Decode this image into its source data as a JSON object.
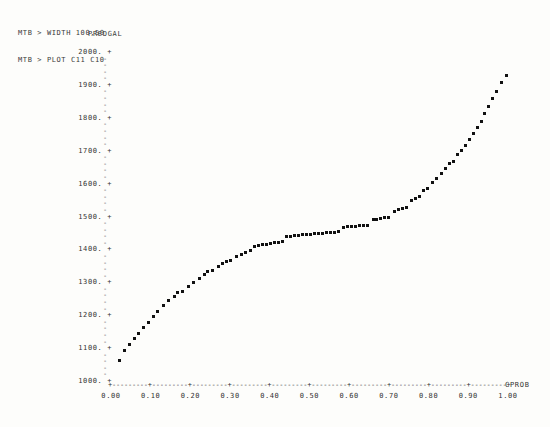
{
  "terminal": {
    "commands": [
      "MTB > WIDTH 100,50",
      "MTB > PLOT C11 C10"
    ]
  },
  "chart_data": {
    "type": "scatter",
    "title": "",
    "xlabel": "CPROB",
    "ylabel": "PREDGAL",
    "xlim": [
      0.0,
      1.0
    ],
    "ylim": [
      1000,
      2000
    ],
    "grid": false,
    "legend": null,
    "y_major_ticks": [
      "2000.",
      "1900.",
      "1800.",
      "1700.",
      "1600.",
      "1500.",
      "1400.",
      "1300.",
      "1200.",
      "1100.",
      "1000."
    ],
    "y_major_values": [
      2000,
      1900,
      1800,
      1700,
      1600,
      1500,
      1400,
      1300,
      1200,
      1100,
      1000
    ],
    "y_tick_glyph": "+",
    "y_minor_glyph": "-",
    "y_minor_per_interval": 4,
    "x_tick_labels": [
      "0.00",
      "0.10",
      "0.20",
      "0.30",
      "0.40",
      "0.50",
      "0.60",
      "0.70",
      "0.80",
      "0.90",
      "1.00"
    ],
    "x_tick_values": [
      0.0,
      0.1,
      0.2,
      0.3,
      0.4,
      0.5,
      0.6,
      0.7,
      0.8,
      0.9,
      1.0
    ],
    "x_axis_tick_glyph": "+",
    "x_axis_fill_glyph": "-",
    "point_glyph": "*",
    "points": [
      [
        0.022,
        1063
      ],
      [
        0.034,
        1092
      ],
      [
        0.046,
        1112
      ],
      [
        0.058,
        1128
      ],
      [
        0.07,
        1145
      ],
      [
        0.082,
        1163
      ],
      [
        0.094,
        1178
      ],
      [
        0.106,
        1196
      ],
      [
        0.118,
        1212
      ],
      [
        0.132,
        1228
      ],
      [
        0.146,
        1244
      ],
      [
        0.16,
        1258
      ],
      [
        0.168,
        1268
      ],
      [
        0.18,
        1272
      ],
      [
        0.194,
        1286
      ],
      [
        0.208,
        1300
      ],
      [
        0.222,
        1312
      ],
      [
        0.236,
        1324
      ],
      [
        0.244,
        1332
      ],
      [
        0.256,
        1336
      ],
      [
        0.27,
        1348
      ],
      [
        0.282,
        1358
      ],
      [
        0.29,
        1362
      ],
      [
        0.302,
        1366
      ],
      [
        0.316,
        1378
      ],
      [
        0.328,
        1384
      ],
      [
        0.34,
        1390
      ],
      [
        0.352,
        1396
      ],
      [
        0.362,
        1410
      ],
      [
        0.372,
        1412
      ],
      [
        0.382,
        1414
      ],
      [
        0.392,
        1416
      ],
      [
        0.402,
        1418
      ],
      [
        0.412,
        1420
      ],
      [
        0.422,
        1422
      ],
      [
        0.432,
        1424
      ],
      [
        0.442,
        1438
      ],
      [
        0.452,
        1440
      ],
      [
        0.462,
        1442
      ],
      [
        0.472,
        1443
      ],
      [
        0.482,
        1444
      ],
      [
        0.492,
        1445
      ],
      [
        0.502,
        1446
      ],
      [
        0.512,
        1447
      ],
      [
        0.522,
        1448
      ],
      [
        0.532,
        1449
      ],
      [
        0.542,
        1450
      ],
      [
        0.552,
        1451
      ],
      [
        0.562,
        1452
      ],
      [
        0.572,
        1453
      ],
      [
        0.586,
        1468
      ],
      [
        0.596,
        1469
      ],
      [
        0.606,
        1470
      ],
      [
        0.616,
        1471
      ],
      [
        0.626,
        1472
      ],
      [
        0.636,
        1473
      ],
      [
        0.646,
        1474
      ],
      [
        0.66,
        1490
      ],
      [
        0.67,
        1492
      ],
      [
        0.68,
        1494
      ],
      [
        0.69,
        1496
      ],
      [
        0.7,
        1498
      ],
      [
        0.714,
        1516
      ],
      [
        0.724,
        1520
      ],
      [
        0.734,
        1524
      ],
      [
        0.744,
        1528
      ],
      [
        0.756,
        1548
      ],
      [
        0.766,
        1554
      ],
      [
        0.776,
        1562
      ],
      [
        0.788,
        1578
      ],
      [
        0.798,
        1586
      ],
      [
        0.81,
        1604
      ],
      [
        0.82,
        1614
      ],
      [
        0.832,
        1632
      ],
      [
        0.842,
        1646
      ],
      [
        0.852,
        1660
      ],
      [
        0.862,
        1668
      ],
      [
        0.872,
        1688
      ],
      [
        0.882,
        1700
      ],
      [
        0.892,
        1716
      ],
      [
        0.902,
        1734
      ],
      [
        0.912,
        1752
      ],
      [
        0.922,
        1770
      ],
      [
        0.932,
        1790
      ],
      [
        0.942,
        1812
      ],
      [
        0.952,
        1834
      ],
      [
        0.962,
        1858
      ],
      [
        0.972,
        1880
      ],
      [
        0.984,
        1906
      ],
      [
        0.996,
        1930
      ]
    ]
  }
}
